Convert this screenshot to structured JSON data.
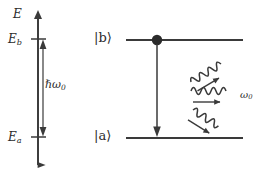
{
  "figure": {
    "background_color": "#ffffff",
    "stroke_color": "#3a3a3a",
    "text_color": "#2b2b2b",
    "width": 268,
    "height": 174
  },
  "energy_axis": {
    "name": "energy-axis",
    "label": "E",
    "arrow_direction": "up",
    "x": 38,
    "y_top": 14,
    "y_bottom": 165,
    "ticks": [
      {
        "label": "E",
        "sub": "b",
        "y": 39
      },
      {
        "label": "E",
        "sub": "a",
        "y": 137
      }
    ]
  },
  "energy_gap": {
    "name": "energy-gap-arrow",
    "label": "ℏω",
    "sub": "0",
    "label_plain": "ℏω₀",
    "arrowheads": "double",
    "x": 43,
    "y_top": 39,
    "y_bottom": 137
  },
  "levels": [
    {
      "id": "upper",
      "ket": "|b⟩",
      "y": 40,
      "x_start": 126,
      "x_end": 243,
      "occupied": true,
      "population_dot_x": 157
    },
    {
      "id": "lower",
      "ket": "|a⟩",
      "y": 138,
      "x_start": 126,
      "x_end": 243,
      "occupied": false
    }
  ],
  "transition": {
    "name": "downward-transition-arrow",
    "from_level": "upper",
    "to_level": "lower",
    "direction": "down",
    "x": 157,
    "y_start": 42,
    "y_end": 136
  },
  "emitted_photons": {
    "label": "ω",
    "sub": "0",
    "label_plain": "ω₀",
    "count": 3,
    "arrows": [
      {
        "id": "photon-up-right",
        "direction": "up-right",
        "angle_deg": -30
      },
      {
        "id": "photon-right",
        "direction": "right",
        "angle_deg": 0
      },
      {
        "id": "photon-down-right",
        "direction": "down-right",
        "angle_deg": 32
      }
    ]
  }
}
